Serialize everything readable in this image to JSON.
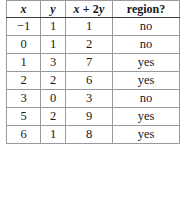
{
  "table": {
    "columns": [
      {
        "key": "x",
        "label": "x",
        "style": "italic-var"
      },
      {
        "key": "y",
        "label": "y",
        "style": "italic-var"
      },
      {
        "key": "expr",
        "label": "x + 2y",
        "style": "italic-expr"
      },
      {
        "key": "region",
        "label": "region?",
        "style": "bold-word"
      }
    ],
    "header": {
      "x": "x",
      "y": "y",
      "expr_x": "x",
      "expr_plus": " + 2",
      "expr_y": "y",
      "region": "region?"
    },
    "rows": [
      {
        "x": "−1",
        "y": "1",
        "expr": "1",
        "region": "no"
      },
      {
        "x": "0",
        "y": "1",
        "expr": "2",
        "region": "no"
      },
      {
        "x": "1",
        "y": "3",
        "expr": "7",
        "region": "yes"
      },
      {
        "x": "2",
        "y": "2",
        "expr": "6",
        "region": "yes"
      },
      {
        "x": "3",
        "y": "0",
        "expr": "3",
        "region": "no"
      },
      {
        "x": "5",
        "y": "2",
        "expr": "9",
        "region": "yes"
      },
      {
        "x": "6",
        "y": "1",
        "expr": "8",
        "region": "yes"
      }
    ]
  },
  "colors": {
    "background": "#ffffff",
    "text": "#17171a",
    "grid_line": "#9a9a9e",
    "header_rule": "#3a3a3e"
  }
}
